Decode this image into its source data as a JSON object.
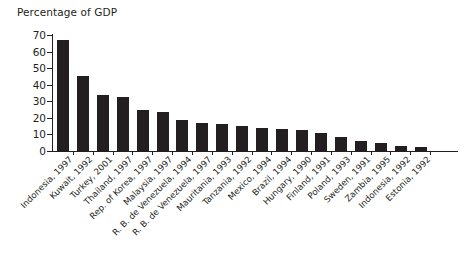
{
  "chart": {
    "title": "Percentage of GDP"
  },
  "chart_data": {
    "type": "bar",
    "title": "Percentage of GDP",
    "xlabel": "",
    "ylabel": "Percentage of GDP",
    "ylim": [
      0,
      70
    ],
    "yticks": [
      0,
      10,
      20,
      30,
      40,
      50,
      60,
      70
    ],
    "ytick_labels": [
      "0",
      "10",
      "20",
      "30",
      "40",
      "50",
      "60",
      "70"
    ],
    "grid": false,
    "legend": null,
    "bar_color": "#231f20",
    "orientation": "vertical",
    "categories": [
      "Indonesia, 1997",
      "Kuwait, 1992",
      "Turkey, 2001",
      "Thailand, 1997",
      "Rep. of Korea, 1997",
      "Malaysia, 1997",
      "R. B. de Venezuela, 1994",
      "R. B. de Venezuela, 1997",
      "Mauritania, 1993",
      "Tanzania, 1992",
      "Mexico, 1994",
      "Brazil, 1994",
      "Hungary, 1990",
      "Finland, 1991",
      "Poland, 1993",
      "Sweden, 1991",
      "Zambia, 1995",
      "Indonesia, 1992",
      "Estonia, 1992"
    ],
    "values": [
      67,
      45,
      34,
      32.5,
      25,
      23.5,
      19,
      17,
      16.5,
      15,
      14,
      13,
      12.5,
      11,
      8.5,
      6,
      5,
      3,
      2.5
    ]
  }
}
